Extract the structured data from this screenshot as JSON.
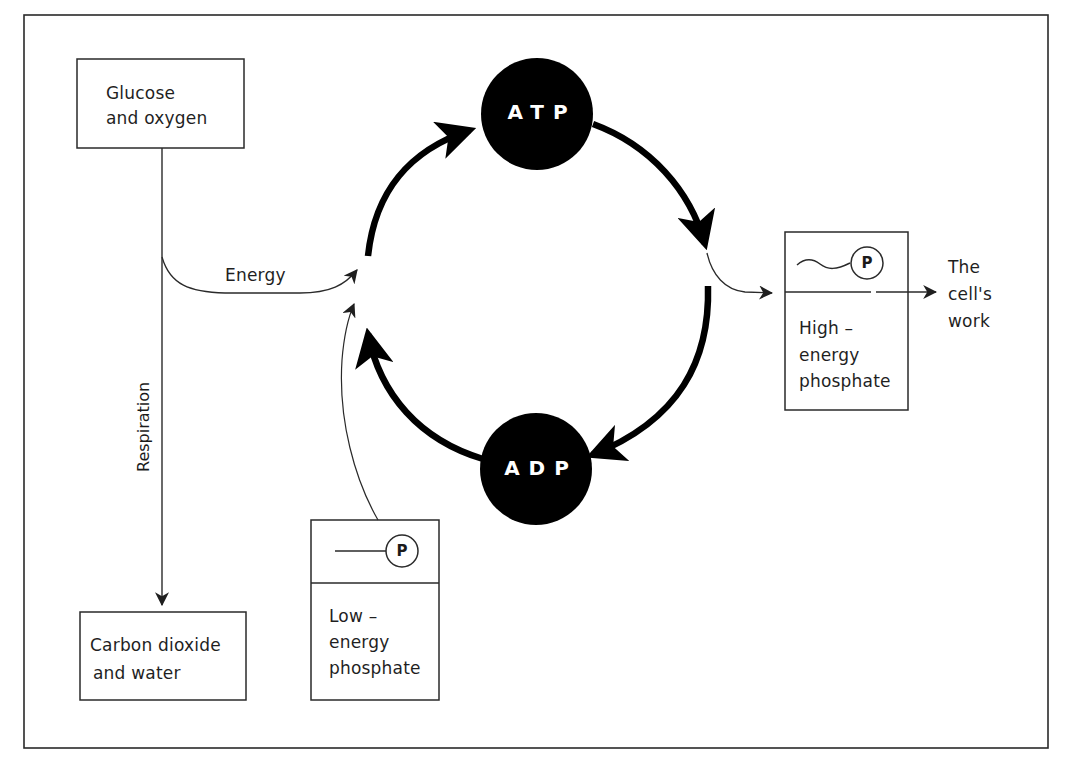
{
  "diagram": {
    "type": "flow-cycle",
    "colors": {
      "line": "#1f1f1f",
      "circle_fill": "#000000",
      "circle_text": "#ffffff",
      "background": "#ffffff"
    },
    "nodes": {
      "glucose": {
        "line1": "Glucose",
        "line2": "and oxygen"
      },
      "co2": {
        "line1": "Carbon dioxide",
        "line2": "and water"
      },
      "atp": {
        "label": "ATP"
      },
      "adp": {
        "label": "ADP"
      },
      "high_phosphate": {
        "symbol": "P",
        "line1": "High –",
        "line2": "energy",
        "line3": "phosphate"
      },
      "low_phosphate": {
        "symbol": "P",
        "line1": "Low –",
        "line2": "energy",
        "line3": "phosphate"
      },
      "cells_work": {
        "line1": "The",
        "line2": "cell's",
        "line3": "work"
      }
    },
    "edge_labels": {
      "energy": "Energy",
      "respiration": "Respiration"
    },
    "edges": [
      {
        "from": "glucose",
        "to": "co2",
        "label": "Respiration"
      },
      {
        "from": "glucose",
        "to": "adp-to-atp-arc",
        "label": "Energy"
      },
      {
        "from": "low_phosphate",
        "to": "adp-to-atp-arc"
      },
      {
        "from": "adp",
        "to": "atp"
      },
      {
        "from": "atp",
        "to": "high_phosphate"
      },
      {
        "from": "high_phosphate",
        "to": "cells_work"
      },
      {
        "from": "atp",
        "to": "adp"
      }
    ]
  }
}
